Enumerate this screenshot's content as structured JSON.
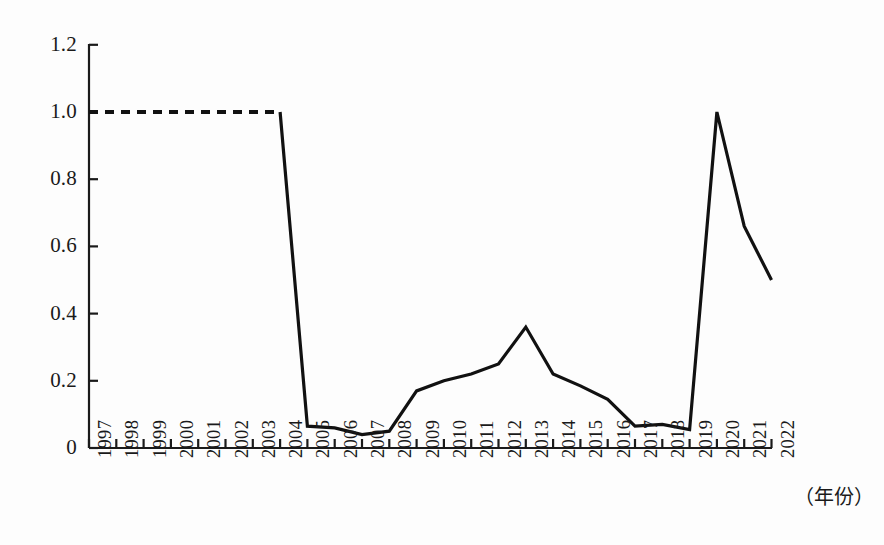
{
  "chart_data": {
    "type": "line",
    "title": "",
    "subtitle": "",
    "xlabel": "（年份）",
    "ylabel": "",
    "xlim": [
      1997,
      2022
    ],
    "ylim": [
      0,
      1.2
    ],
    "grid": false,
    "legend": null,
    "legend_position": "none",
    "x": [
      1997,
      1998,
      1999,
      2000,
      2001,
      2002,
      2003,
      2004,
      2005,
      2006,
      2007,
      2008,
      2009,
      2010,
      2011,
      2012,
      2013,
      2014,
      2015,
      2016,
      2017,
      2018,
      2019,
      2020,
      2021,
      2022
    ],
    "categories": [
      "1997",
      "1998",
      "1999",
      "2000",
      "2001",
      "2002",
      "2003",
      "2004",
      "2005",
      "2006",
      "2007",
      "2008",
      "2009",
      "2010",
      "2011",
      "2012",
      "2013",
      "2014",
      "2015",
      "2016",
      "2017",
      "2018",
      "2019",
      "2020",
      "2021",
      "2022"
    ],
    "values": [
      1.0,
      1.0,
      1.0,
      1.0,
      1.0,
      1.0,
      1.0,
      1.0,
      0.065,
      0.06,
      0.04,
      0.05,
      0.17,
      0.2,
      0.22,
      0.25,
      0.36,
      0.22,
      0.185,
      0.145,
      0.065,
      0.07,
      0.055,
      1.0,
      0.66,
      0.5
    ],
    "series": [
      {
        "name": "series-1",
        "style": "dashed",
        "x": [
          1997,
          1998,
          1999,
          2000,
          2001,
          2002,
          2003,
          2004
        ],
        "values": [
          1.0,
          1.0,
          1.0,
          1.0,
          1.0,
          1.0,
          1.0,
          1.0
        ]
      },
      {
        "name": "series-1-solid",
        "style": "solid",
        "x": [
          2004,
          2005,
          2006,
          2007,
          2008,
          2009,
          2010,
          2011,
          2012,
          2013,
          2014,
          2015,
          2016,
          2017,
          2018,
          2019,
          2020,
          2021,
          2022
        ],
        "values": [
          1.0,
          0.065,
          0.06,
          0.04,
          0.05,
          0.17,
          0.2,
          0.22,
          0.25,
          0.36,
          0.22,
          0.185,
          0.145,
          0.065,
          0.07,
          0.055,
          1.0,
          0.66,
          0.5
        ]
      }
    ],
    "yticks": [
      0,
      0.2,
      0.4,
      0.6,
      0.8,
      1.0,
      1.2
    ],
    "ytick_labels": [
      "0",
      "0.2",
      "0.4",
      "0.6",
      "0.8",
      "1.0",
      "1.2"
    ],
    "xticks": [
      1997,
      1998,
      1999,
      2000,
      2001,
      2002,
      2003,
      2004,
      2005,
      2006,
      2007,
      2008,
      2009,
      2010,
      2011,
      2012,
      2013,
      2014,
      2015,
      2016,
      2017,
      2018,
      2019,
      2020,
      2021,
      2022
    ],
    "annotations": [],
    "line_color": "#111111",
    "axis_color": "#1a1a1a",
    "background_color": "#fdfdfd"
  },
  "axis": {
    "x_title": "（年份）",
    "y_tick_labels": [
      "1.2",
      "1.0",
      "0.8",
      "0.6",
      "0.4",
      "0.2",
      "0"
    ],
    "x_tick_labels": [
      "1997",
      "1998",
      "1999",
      "2000",
      "2001",
      "2002",
      "2003",
      "2004",
      "2005",
      "2006",
      "2007",
      "2008",
      "2009",
      "2010",
      "2011",
      "2012",
      "2013",
      "2014",
      "2015",
      "2016",
      "2017",
      "2018",
      "2019",
      "2020",
      "2021",
      "2022"
    ]
  }
}
